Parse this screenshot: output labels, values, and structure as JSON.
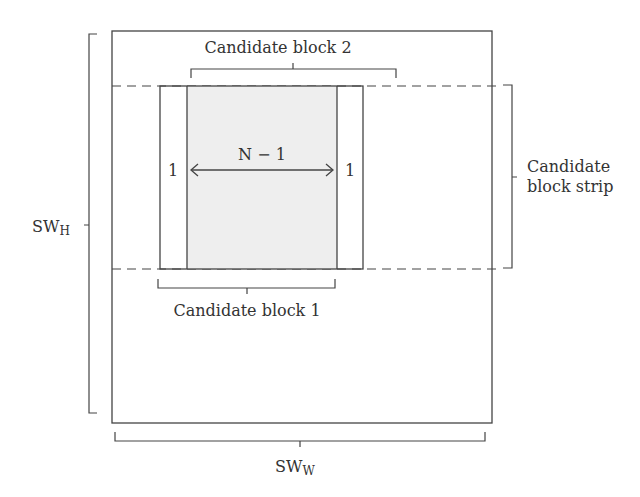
{
  "diagram": {
    "labels": {
      "candidate_block_2": "Candidate block 2",
      "candidate_block_1": "Candidate block 1",
      "candidate_block_strip_line1": "Candidate",
      "candidate_block_strip_line2": "block strip",
      "n_minus_1": "N − 1",
      "left_one": "1",
      "right_one": "1",
      "sw_h_main": "SW",
      "sw_h_sub": "H",
      "sw_w_main": "SW",
      "sw_w_sub": "W"
    },
    "colors": {
      "line": "#444444",
      "shaded_fill": "#eeeeee",
      "text": "#333333"
    }
  }
}
